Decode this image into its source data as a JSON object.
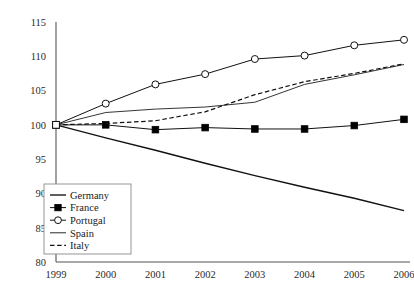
{
  "chart_data": {
    "type": "line",
    "title": "",
    "xlabel": "",
    "ylabel": "",
    "x": [
      1999,
      2000,
      2001,
      2002,
      2003,
      2004,
      2005,
      2006
    ],
    "xtick_labels": [
      "1999",
      "2000",
      "2001",
      "2002",
      "2003",
      "2004",
      "2005",
      "2006"
    ],
    "ytick_labels": [
      "80",
      "85",
      "90",
      "95",
      "100",
      "105",
      "110",
      "115"
    ],
    "yticks": [
      80,
      85,
      90,
      95,
      100,
      105,
      110,
      115
    ],
    "ylim": [
      80,
      115
    ],
    "xlim": [
      1999,
      2006
    ],
    "grid": false,
    "legend_position": "lower-left",
    "series": [
      {
        "name": "Germany",
        "style": "solid",
        "marker": "none",
        "color": "#111111",
        "values": [
          100.0,
          98.1,
          96.3,
          94.4,
          92.6,
          90.9,
          89.3,
          87.5
        ]
      },
      {
        "name": "France",
        "style": "solid",
        "marker": "filled-square",
        "color": "#111111",
        "values": [
          100.0,
          100.0,
          99.3,
          99.6,
          99.4,
          99.4,
          99.9,
          100.8
        ]
      },
      {
        "name": "Portugal",
        "style": "solid",
        "marker": "open-circle",
        "color": "#111111",
        "values": [
          100.0,
          103.1,
          105.9,
          107.4,
          109.6,
          110.1,
          111.6,
          112.4
        ]
      },
      {
        "name": "Spain",
        "style": "solid",
        "marker": "none",
        "color": "#111111",
        "values": [
          100.0,
          101.8,
          102.3,
          102.6,
          103.3,
          105.9,
          107.3,
          108.8
        ]
      },
      {
        "name": "Italy",
        "style": "dashed",
        "marker": "none",
        "color": "#111111",
        "values": [
          100.0,
          100.2,
          100.6,
          101.9,
          104.4,
          106.3,
          107.5,
          108.9
        ]
      }
    ]
  },
  "legend": {
    "entries": [
      {
        "label": "Germany"
      },
      {
        "label": "France"
      },
      {
        "label": "Portugal"
      },
      {
        "label": "Spain"
      },
      {
        "label": "Italy"
      }
    ]
  }
}
